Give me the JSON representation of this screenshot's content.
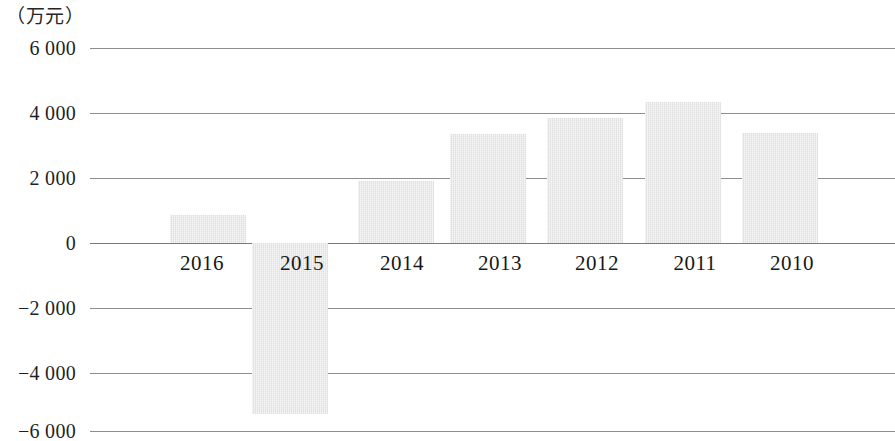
{
  "chart_data": {
    "type": "bar",
    "title": "",
    "subtitle": "",
    "unit_label": "（万元）",
    "xlabel": "",
    "ylabel": "",
    "categories": [
      "2016",
      "2015",
      "2014",
      "2013",
      "2012",
      "2011",
      "2010"
    ],
    "values": [
      850,
      -5250,
      1900,
      3350,
      3850,
      4350,
      3400
    ],
    "series": [
      {
        "name": "",
        "values": [
          850,
          -5250,
          1900,
          3350,
          3850,
          4350,
          3400
        ]
      }
    ],
    "ylim": [
      -6000,
      6000
    ],
    "yticks": [
      6000,
      4000,
      2000,
      0,
      -2000,
      -4000,
      -6000
    ],
    "ytick_labels": [
      "6 000",
      "4 000",
      "2 000",
      "0",
      "−2 000",
      "−4 000",
      "−6 000"
    ],
    "grid": true,
    "legend": false,
    "legend_position": "none",
    "bar_color": "#e6e7e6",
    "gridline_color": "#8e8e8e",
    "text_color": "#1a1a1a",
    "annotations": []
  },
  "axis": {
    "y": {
      "ticks": [
        {
          "label": "6 000",
          "value": 6000
        },
        {
          "label": "4 000",
          "value": 4000
        },
        {
          "label": "2 000",
          "value": 2000
        },
        {
          "label": "0",
          "value": 0
        },
        {
          "label": "−2 000",
          "value": -2000
        },
        {
          "label": "−4 000",
          "value": -4000
        },
        {
          "label": "−6 000",
          "value": -6000
        }
      ]
    },
    "x": {
      "ticks": [
        {
          "label": "2016"
        },
        {
          "label": "2015"
        },
        {
          "label": "2014"
        },
        {
          "label": "2013"
        },
        {
          "label": "2012"
        },
        {
          "label": "2011"
        },
        {
          "label": "2010"
        }
      ]
    }
  }
}
